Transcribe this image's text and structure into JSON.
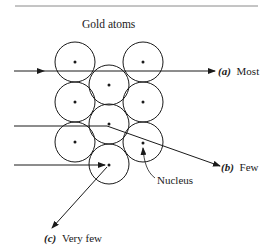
{
  "diagram": {
    "title": "Gold atoms",
    "atom_radius": 20,
    "atoms": [
      {
        "cx": 75,
        "cy": 62
      },
      {
        "cx": 143,
        "cy": 62
      },
      {
        "cx": 109,
        "cy": 85
      },
      {
        "cx": 75,
        "cy": 102
      },
      {
        "cx": 143,
        "cy": 102
      },
      {
        "cx": 109,
        "cy": 124
      },
      {
        "cx": 75,
        "cy": 142
      },
      {
        "cx": 143,
        "cy": 142
      },
      {
        "cx": 109,
        "cy": 164
      }
    ],
    "paths": [
      {
        "id": "a",
        "letter": "(a)",
        "label": "Most"
      },
      {
        "id": "b",
        "letter": "(b)",
        "label": "Few"
      },
      {
        "id": "c",
        "letter": "(c)",
        "label": "Very few"
      }
    ],
    "nucleus_label": "Nucleus",
    "colors": {
      "line": "#1a1a1a",
      "background": "#ffffff"
    }
  }
}
